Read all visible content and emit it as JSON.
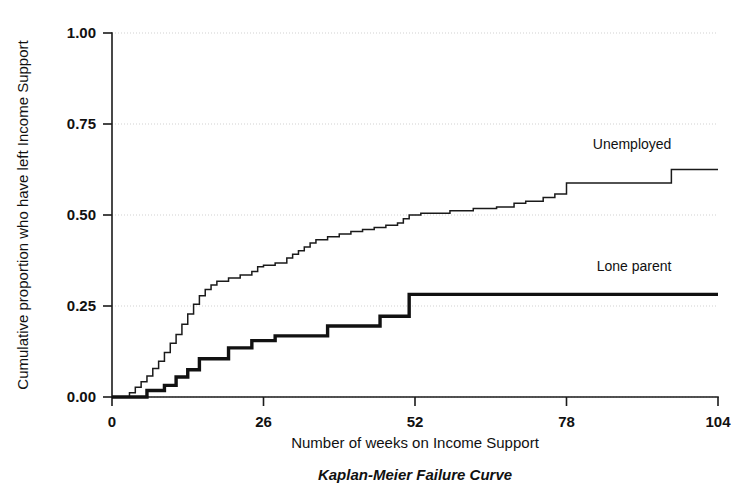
{
  "chart_data": {
    "type": "line",
    "subtype": "step",
    "title": "Kaplan-Meier Failure Curve",
    "xlabel": "Number of weeks on Income Support",
    "ylabel": "Cumulative proportion who have left Income Support",
    "xlim": [
      0,
      104
    ],
    "ylim": [
      0,
      1.0
    ],
    "xticks": [
      0,
      26,
      52,
      78,
      104
    ],
    "xtick_labels": [
      "0",
      "26",
      "52",
      "78",
      "104"
    ],
    "yticks": [
      0.0,
      0.25,
      0.5,
      0.75,
      1.0
    ],
    "ytick_labels": [
      "0.00",
      "0.25",
      "0.50",
      "0.75",
      "1.00"
    ],
    "grid": "horizontal-dotted",
    "legend_position": "inline-right-of-curves",
    "series": [
      {
        "name": "Unemployed",
        "label": "Unemployed",
        "line_weight": "thin",
        "color": "#1a1a1a",
        "label_x": 96,
        "label_y": 0.68,
        "points": [
          [
            0,
            0.0
          ],
          [
            3,
            0.0
          ],
          [
            3,
            0.012
          ],
          [
            4,
            0.012
          ],
          [
            4,
            0.027
          ],
          [
            5,
            0.027
          ],
          [
            5,
            0.042
          ],
          [
            6,
            0.042
          ],
          [
            6,
            0.058
          ],
          [
            7,
            0.058
          ],
          [
            7,
            0.078
          ],
          [
            8,
            0.078
          ],
          [
            8,
            0.098
          ],
          [
            9,
            0.098
          ],
          [
            9,
            0.122
          ],
          [
            10,
            0.122
          ],
          [
            10,
            0.148
          ],
          [
            11,
            0.148
          ],
          [
            11,
            0.172
          ],
          [
            12,
            0.172
          ],
          [
            12,
            0.2
          ],
          [
            13,
            0.2
          ],
          [
            13,
            0.228
          ],
          [
            14,
            0.228
          ],
          [
            14,
            0.255
          ],
          [
            15,
            0.255
          ],
          [
            15,
            0.278
          ],
          [
            16,
            0.278
          ],
          [
            16,
            0.295
          ],
          [
            17,
            0.295
          ],
          [
            17,
            0.308
          ],
          [
            18,
            0.308
          ],
          [
            18,
            0.318
          ],
          [
            20,
            0.318
          ],
          [
            20,
            0.327
          ],
          [
            22,
            0.327
          ],
          [
            22,
            0.335
          ],
          [
            24,
            0.335
          ],
          [
            24,
            0.345
          ],
          [
            25,
            0.345
          ],
          [
            25,
            0.358
          ],
          [
            26,
            0.358
          ],
          [
            26,
            0.362
          ],
          [
            28,
            0.362
          ],
          [
            28,
            0.368
          ],
          [
            30,
            0.368
          ],
          [
            30,
            0.382
          ],
          [
            31,
            0.382
          ],
          [
            31,
            0.392
          ],
          [
            32,
            0.392
          ],
          [
            32,
            0.402
          ],
          [
            33,
            0.402
          ],
          [
            33,
            0.412
          ],
          [
            34,
            0.412
          ],
          [
            34,
            0.423
          ],
          [
            35,
            0.423
          ],
          [
            35,
            0.432
          ],
          [
            37,
            0.432
          ],
          [
            37,
            0.44
          ],
          [
            39,
            0.44
          ],
          [
            39,
            0.448
          ],
          [
            41,
            0.448
          ],
          [
            41,
            0.455
          ],
          [
            43,
            0.455
          ],
          [
            43,
            0.46
          ],
          [
            45,
            0.46
          ],
          [
            45,
            0.466
          ],
          [
            47,
            0.466
          ],
          [
            47,
            0.472
          ],
          [
            49,
            0.472
          ],
          [
            49,
            0.478
          ],
          [
            50,
            0.478
          ],
          [
            50,
            0.49
          ],
          [
            51,
            0.49
          ],
          [
            51,
            0.5
          ],
          [
            53,
            0.5
          ],
          [
            53,
            0.505
          ],
          [
            58,
            0.505
          ],
          [
            58,
            0.512
          ],
          [
            62,
            0.512
          ],
          [
            62,
            0.518
          ],
          [
            66,
            0.518
          ],
          [
            66,
            0.522
          ],
          [
            69,
            0.522
          ],
          [
            69,
            0.532
          ],
          [
            71,
            0.532
          ],
          [
            71,
            0.538
          ],
          [
            74,
            0.538
          ],
          [
            74,
            0.548
          ],
          [
            76,
            0.548
          ],
          [
            76,
            0.558
          ],
          [
            78,
            0.558
          ],
          [
            78,
            0.588
          ],
          [
            96,
            0.588
          ],
          [
            96,
            0.625
          ],
          [
            104,
            0.625
          ]
        ]
      },
      {
        "name": "Lone parent",
        "label": "Lone parent",
        "line_weight": "thick",
        "color": "#111111",
        "label_x": 96,
        "label_y": 0.345,
        "points": [
          [
            0,
            0.0
          ],
          [
            6,
            0.0
          ],
          [
            6,
            0.018
          ],
          [
            9,
            0.018
          ],
          [
            9,
            0.032
          ],
          [
            11,
            0.032
          ],
          [
            11,
            0.055
          ],
          [
            13,
            0.055
          ],
          [
            13,
            0.075
          ],
          [
            15,
            0.075
          ],
          [
            15,
            0.105
          ],
          [
            20,
            0.105
          ],
          [
            20,
            0.135
          ],
          [
            24,
            0.135
          ],
          [
            24,
            0.155
          ],
          [
            28,
            0.155
          ],
          [
            28,
            0.168
          ],
          [
            37,
            0.168
          ],
          [
            37,
            0.195
          ],
          [
            46,
            0.195
          ],
          [
            46,
            0.222
          ],
          [
            51,
            0.222
          ],
          [
            51,
            0.282
          ],
          [
            104,
            0.282
          ]
        ]
      }
    ]
  },
  "layout": {
    "plot_left_px": 112,
    "plot_right_px": 718,
    "plot_top_px": 33,
    "plot_bottom_px": 397
  }
}
